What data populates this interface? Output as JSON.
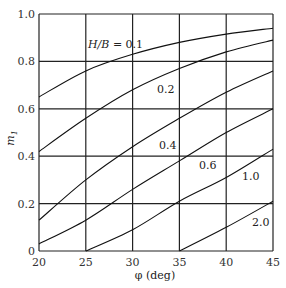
{
  "chart_data": {
    "type": "line",
    "title": "",
    "xlabel": "φ (deg)",
    "ylabel": "m1",
    "xlim": [
      20,
      45
    ],
    "ylim": [
      0,
      1.0
    ],
    "xticks": [
      20,
      25,
      30,
      35,
      40,
      45
    ],
    "yticks": [
      0,
      0.2,
      0.4,
      0.6,
      0.8,
      1.0
    ],
    "ytick_labels": [
      "0",
      "0.2",
      "0.4",
      "0.6",
      "0.8",
      "1.0"
    ],
    "grid": true,
    "legend": "inline curve labels",
    "x": [
      20,
      25,
      30,
      35,
      40,
      45
    ],
    "series": [
      {
        "name": "H/B = 0.1",
        "label": "H/B = 0.1",
        "values": [
          0.65,
          0.76,
          0.83,
          0.88,
          0.915,
          0.94
        ]
      },
      {
        "name": "0.2",
        "label": "0.2",
        "values": [
          0.42,
          0.56,
          0.68,
          0.77,
          0.84,
          0.89
        ]
      },
      {
        "name": "0.4",
        "label": "0.4",
        "values": [
          0.13,
          0.3,
          0.44,
          0.56,
          0.67,
          0.76
        ]
      },
      {
        "name": "0.6",
        "label": "0.6",
        "values": [
          0.03,
          0.13,
          0.26,
          0.38,
          0.5,
          0.6
        ]
      },
      {
        "name": "1.0",
        "label": "1.0",
        "values": [
          null,
          0.0,
          0.09,
          0.21,
          0.31,
          0.43
        ]
      },
      {
        "name": "2.0",
        "label": "2.0",
        "values": [
          null,
          null,
          null,
          0.0,
          0.1,
          0.21
        ]
      }
    ],
    "series_start_x": {
      "1.0": 25,
      "2.0": 35
    }
  },
  "labels": {
    "xlabel": "φ (deg)",
    "ylabel_main": "m",
    "ylabel_sub": "1",
    "hb_prefix": "H/B",
    "hb_eq": " = 0.1"
  }
}
